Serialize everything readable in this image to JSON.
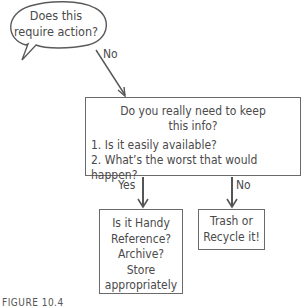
{
  "diagram": {
    "type": "flowchart",
    "start": {
      "text_line1": "Does this",
      "text_line2": "require action?"
    },
    "edge_start_to_main": {
      "label": "No"
    },
    "main": {
      "question_line1": "Do you really need to keep",
      "question_line2": "this info?",
      "items": [
        "1. Is it easily available?",
        "2. What’s the worst that would happen?"
      ]
    },
    "edge_main_to_yes": {
      "label": "Yes"
    },
    "edge_main_to_no": {
      "label": "No"
    },
    "yes_box": {
      "lines": [
        "Is it Handy",
        "Reference?",
        "Archive?",
        "Store",
        "appropriately"
      ]
    },
    "no_box": {
      "lines": [
        "Trash or",
        "Recycle it!"
      ]
    },
    "caption": "FIGURE 10.4"
  },
  "colors": {
    "stroke": "#5a5a5a",
    "text": "#4a4a4a",
    "background": "#ffffff"
  }
}
